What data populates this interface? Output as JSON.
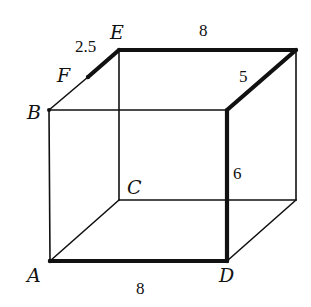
{
  "figure": {
    "type": "cube-diagram",
    "vertices": {
      "A": {
        "label": "A",
        "x": 50,
        "y": 261
      },
      "B": {
        "label": "B",
        "x": 49,
        "y": 110
      },
      "C": {
        "label": "C",
        "x": 119,
        "y": 200
      },
      "D": {
        "label": "D",
        "x": 227,
        "y": 261
      },
      "E": {
        "label": "E",
        "x": 119,
        "y": 50
      },
      "F": {
        "label": "F",
        "x": 88,
        "y": 77
      },
      "front_top_right": {
        "x": 227,
        "y": 110
      },
      "back_top_right": {
        "x": 296,
        "y": 50
      },
      "back_bottom_right": {
        "x": 296,
        "y": 200
      }
    },
    "labels": {
      "A": "A",
      "B": "B",
      "C": "C",
      "D": "D",
      "E": "E",
      "F": "F"
    },
    "measurements": {
      "EF": "2.5",
      "E_to_back_top_right": "8",
      "back_top_right_to_front_top_right": "5",
      "front_vertical_edge": "6",
      "AD": "8"
    },
    "highlighted_edges": [
      "F-E",
      "E-back_top_right",
      "back_top_right-front_top_right",
      "front_top_right-D",
      "A-D"
    ],
    "colors": {
      "line": "#111111",
      "background": "#ffffff"
    }
  }
}
